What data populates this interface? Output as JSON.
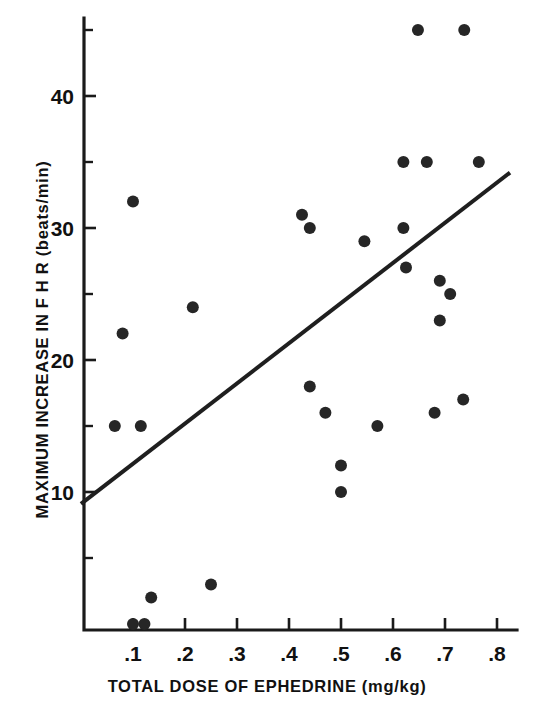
{
  "figure": {
    "background": "#ffffff",
    "ink_color": "#1a1a1a",
    "point_color": "#262626"
  },
  "axes": {
    "x_title": "TOTAL DOSE OF EPHEDRINE  (mg/kg)",
    "y_title": "MAXIMUM INCREASE IN F H R  (beats/min)",
    "x_ticks": [
      ".1",
      ".2",
      ".3",
      ".4",
      ".5",
      ".6",
      ".7",
      ".8"
    ],
    "y_ticks": [
      "10",
      "20",
      "30",
      "40"
    ]
  },
  "chart_data": {
    "type": "scatter",
    "title": "",
    "xlabel": "TOTAL DOSE OF EPHEDRINE  (mg/kg)",
    "ylabel": "MAXIMUM INCREASE IN F H R  (beats/min)",
    "xlim": [
      0.0,
      0.845
    ],
    "ylim": [
      0,
      46
    ],
    "x_tick_values": [
      0.1,
      0.2,
      0.3,
      0.4,
      0.5,
      0.6,
      0.7,
      0.8
    ],
    "x_tick_labels": [
      ".1",
      ".2",
      ".3",
      ".4",
      ".5",
      ".6",
      ".7",
      ".8"
    ],
    "y_tick_values": [
      10,
      20,
      30,
      40
    ],
    "y_tick_labels": [
      "10",
      "20",
      "30",
      "40"
    ],
    "y_minor_tick_values": [
      5,
      15,
      25,
      35,
      45
    ],
    "grid": false,
    "legend": null,
    "marker": "filled-circle",
    "points": [
      {
        "x": 0.065,
        "y": 15
      },
      {
        "x": 0.08,
        "y": 22
      },
      {
        "x": 0.1,
        "y": 32
      },
      {
        "x": 0.1,
        "y": 0
      },
      {
        "x": 0.115,
        "y": 15
      },
      {
        "x": 0.122,
        "y": 0
      },
      {
        "x": 0.135,
        "y": 2
      },
      {
        "x": 0.215,
        "y": 24
      },
      {
        "x": 0.25,
        "y": 3
      },
      {
        "x": 0.425,
        "y": 31
      },
      {
        "x": 0.44,
        "y": 30
      },
      {
        "x": 0.44,
        "y": 18
      },
      {
        "x": 0.47,
        "y": 16
      },
      {
        "x": 0.5,
        "y": 12
      },
      {
        "x": 0.5,
        "y": 10
      },
      {
        "x": 0.545,
        "y": 29
      },
      {
        "x": 0.57,
        "y": 15
      },
      {
        "x": 0.62,
        "y": 30
      },
      {
        "x": 0.62,
        "y": 35
      },
      {
        "x": 0.625,
        "y": 27
      },
      {
        "x": 0.648,
        "y": 45
      },
      {
        "x": 0.665,
        "y": 35
      },
      {
        "x": 0.68,
        "y": 16
      },
      {
        "x": 0.69,
        "y": 26
      },
      {
        "x": 0.69,
        "y": 23
      },
      {
        "x": 0.71,
        "y": 25
      },
      {
        "x": 0.735,
        "y": 17
      },
      {
        "x": 0.737,
        "y": 45
      },
      {
        "x": 0.765,
        "y": 35
      }
    ],
    "regression_line": {
      "x_start": 0.0,
      "y_start": 9.1,
      "x_end": 0.825,
      "y_end": 34.2
    }
  }
}
